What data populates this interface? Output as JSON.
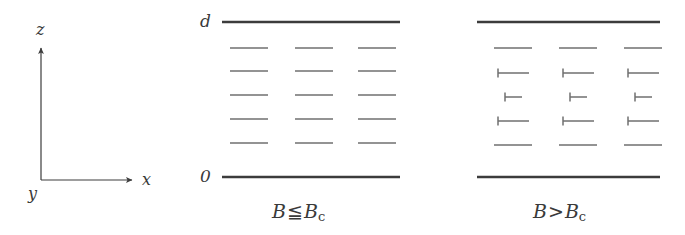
{
  "figure": {
    "background_color": "#ffffff",
    "line_color": "#3c3c3c",
    "faint_line_color": "#6f6f6f"
  },
  "axes": {
    "name": "coordinate-axes",
    "origin": {
      "x": 41,
      "y": 180
    },
    "z_axis": {
      "label": "z",
      "from_y": 180,
      "to_y": 48,
      "label_x": 36,
      "label_y": 22
    },
    "x_axis": {
      "label": "x",
      "from_x": 41,
      "to_x": 132,
      "label_x": 142,
      "label_y": 172
    },
    "y_axis": {
      "label": "y",
      "label_x": 28,
      "label_y": 186
    }
  },
  "panels": [
    {
      "id": "panel-b-le-bc",
      "name": "meissner-panel",
      "caption": {
        "symbol": "B",
        "operator": "≦",
        "symbol2": "B",
        "subscript": "c"
      },
      "caption_x": 272,
      "caption_y": 202,
      "boundaries": {
        "top": {
          "label": "d",
          "y": 22,
          "x1": 222,
          "x2": 400,
          "label_x": 200,
          "label_y": 13
        },
        "bottom": {
          "label": "0",
          "y": 177,
          "x1": 222,
          "x2": 400,
          "label_x": 200,
          "label_y": 168
        }
      },
      "columns_x": [
        230,
        295,
        358
      ],
      "rows_y": [
        48,
        71,
        95,
        119,
        143
      ],
      "marks": [
        {
          "row": 0,
          "type": "dash",
          "length": 38,
          "tick": 0
        },
        {
          "row": 1,
          "type": "dash",
          "length": 38,
          "tick": 0
        },
        {
          "row": 2,
          "type": "dash",
          "length": 38,
          "tick": 0
        },
        {
          "row": 3,
          "type": "dash",
          "length": 38,
          "tick": 0
        },
        {
          "row": 4,
          "type": "dash",
          "length": 38,
          "tick": 0
        }
      ]
    },
    {
      "id": "panel-b-gt-bc",
      "name": "vortex-panel",
      "caption": {
        "symbol": "B",
        "operator": ">",
        "symbol2": "B",
        "subscript": "c"
      },
      "caption_x": 533,
      "caption_y": 202,
      "boundaries": {
        "top": {
          "label": "",
          "y": 22,
          "x1": 477,
          "x2": 660,
          "label_x": 0,
          "label_y": 0
        },
        "bottom": {
          "label": "",
          "y": 177,
          "x1": 477,
          "x2": 660,
          "label_x": 0,
          "label_y": 0
        }
      },
      "columns_x": [
        490,
        555,
        620
      ],
      "rows_y": [
        48,
        73,
        97,
        121,
        145
      ],
      "marks": [
        {
          "row": 0,
          "type": "dash",
          "length": 38,
          "tick": 0,
          "offset": 4
        },
        {
          "row": 1,
          "type": "tee",
          "length": 31,
          "tick": 9,
          "offset": 8
        },
        {
          "row": 2,
          "type": "tee",
          "length": 17,
          "tick": 9,
          "offset": 15
        },
        {
          "row": 3,
          "type": "tee",
          "length": 31,
          "tick": 9,
          "offset": 8
        },
        {
          "row": 4,
          "type": "dash",
          "length": 38,
          "tick": 0,
          "offset": 4
        }
      ]
    }
  ]
}
